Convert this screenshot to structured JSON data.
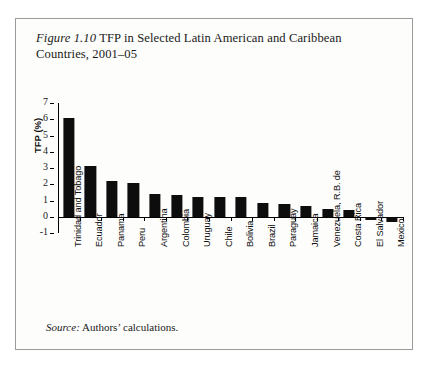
{
  "figure": {
    "label": "Figure 1.10",
    "title": " TFP in Selected Latin American and Caribbean Countries, 2001–05",
    "source_label": "Source:",
    "source_text": " Authors’ calculations."
  },
  "chart_data": {
    "type": "bar",
    "title": "Figure 1.10 TFP in Selected Latin American and Caribbean Countries, 2001–05",
    "xlabel": "",
    "ylabel": "TFP (%)",
    "ylim": [
      -1,
      7
    ],
    "yticks": [
      7,
      6,
      5,
      4,
      3,
      2,
      1,
      0,
      -1
    ],
    "grid": false,
    "legend": false,
    "bar_color": "#0d0d0d",
    "categories": [
      "Trinidad and Tobago",
      "Ecuador",
      "Panama",
      "Peru",
      "Argentina",
      "Colombia",
      "Uruguay",
      "Chile",
      "Bolivia",
      "Brazil",
      "Paraguay",
      "Jamaica",
      "Venezuela, R.B. de",
      "Costa Rica",
      "El Salvador",
      "Mexico"
    ],
    "values": [
      6.1,
      3.1,
      2.2,
      2.1,
      1.4,
      1.35,
      1.2,
      1.2,
      1.2,
      0.85,
      0.8,
      0.65,
      0.5,
      0.4,
      -0.2,
      -0.35
    ]
  }
}
